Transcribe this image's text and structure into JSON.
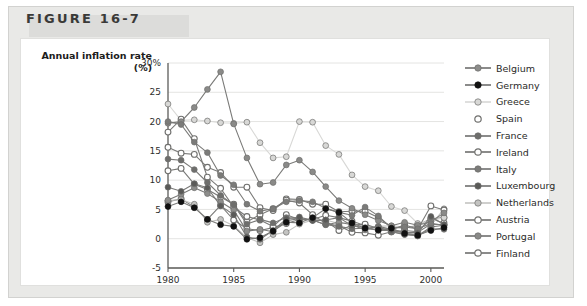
{
  "figure": {
    "number_label": "FIGURE 16-7"
  },
  "axis": {
    "y_title_line1": "Annual inflation rate",
    "y_title_line2": "(%)",
    "y_ticks": [
      "30%",
      "25",
      "20",
      "15",
      "10",
      "5",
      "0",
      "-5"
    ],
    "x_ticks": [
      "1980",
      "1985",
      "1990",
      "1995",
      "2000"
    ]
  },
  "colors": {
    "belgium": "#8d8d8b",
    "germany": "#111111",
    "greece": "#d8d8d6",
    "spain": "#ffffff",
    "france": "#6e6e6c",
    "ireland": "#8f8f8d",
    "italy": "#7b7b79",
    "luxembourg": "#5a5a58",
    "netherlands": "#c3c3c1",
    "austria": "#ffffff",
    "portugal": "#8a8a88",
    "finland": "#ffffff",
    "stroke": "#6b6b69",
    "grid": "#e4e4e2",
    "axis": "#5c5c5a",
    "panel": "#e9e9e7",
    "header_band": "#dcdcda",
    "card": "#ffffff"
  },
  "chart_data": {
    "type": "line",
    "title": "Annual inflation rate (%)",
    "xlabel": "",
    "ylabel": "Annual inflation rate (%)",
    "xlim": [
      1980,
      2001
    ],
    "ylim": [
      -5,
      30
    ],
    "grid": true,
    "legend_position": "right",
    "x": [
      1980,
      1981,
      1982,
      1983,
      1984,
      1985,
      1986,
      1987,
      1988,
      1989,
      1990,
      1991,
      1992,
      1993,
      1994,
      1995,
      1996,
      1997,
      1998,
      1999,
      2000,
      2001
    ],
    "series": [
      {
        "name": "Belgium",
        "color": "#8d8d8b",
        "filled": true,
        "values": [
          6.6,
          7.6,
          8.7,
          7.7,
          6.3,
          4.9,
          1.3,
          1.6,
          1.2,
          3.1,
          3.4,
          3.2,
          2.4,
          2.8,
          2.4,
          1.5,
          2.1,
          1.6,
          1.0,
          1.1,
          2.5,
          2.4
        ]
      },
      {
        "name": "Germany",
        "color": "#111111",
        "filled": true,
        "values": [
          5.5,
          6.3,
          5.3,
          3.3,
          2.4,
          2.1,
          -0.1,
          0.2,
          1.3,
          2.8,
          2.7,
          3.6,
          5.1,
          4.5,
          2.7,
          1.8,
          1.5,
          1.8,
          0.9,
          0.6,
          1.4,
          1.9
        ]
      },
      {
        "name": "Greece",
        "color": "#d8d8d6",
        "filled": true,
        "values": [
          23.0,
          20.2,
          20.3,
          20.1,
          19.8,
          19.7,
          19.9,
          16.4,
          13.8,
          14.0,
          20.0,
          19.9,
          15.9,
          14.4,
          10.9,
          8.9,
          8.2,
          5.5,
          4.8,
          2.6,
          3.1,
          3.6
        ]
      },
      {
        "name": "Spain",
        "color": "#ffffff",
        "filled": false,
        "values": [
          15.6,
          14.6,
          14.4,
          12.2,
          11.3,
          8.8,
          8.8,
          5.3,
          4.8,
          6.8,
          6.7,
          5.9,
          5.9,
          4.6,
          4.7,
          4.7,
          3.6,
          2.0,
          1.8,
          2.3,
          3.4,
          3.6
        ]
      },
      {
        "name": "France",
        "color": "#6e6e6c",
        "filled": true,
        "values": [
          13.6,
          13.4,
          11.8,
          9.6,
          7.4,
          5.8,
          2.5,
          3.3,
          2.7,
          3.6,
          3.4,
          3.2,
          2.4,
          2.1,
          1.7,
          1.8,
          2.0,
          1.2,
          0.7,
          0.5,
          1.7,
          1.6
        ]
      },
      {
        "name": "Ireland",
        "color": "#8f8f8d",
        "filled": false,
        "values": [
          18.2,
          20.4,
          17.1,
          10.5,
          8.6,
          5.4,
          3.8,
          3.2,
          2.1,
          4.1,
          3.3,
          3.2,
          3.1,
          1.4,
          2.3,
          2.5,
          1.7,
          1.5,
          2.4,
          1.6,
          5.6,
          4.9
        ]
      },
      {
        "name": "Italy",
        "color": "#7b7b79",
        "filled": true,
        "values": [
          20.0,
          19.5,
          16.5,
          14.7,
          10.8,
          9.2,
          5.9,
          4.7,
          5.1,
          6.3,
          6.5,
          6.3,
          5.2,
          4.5,
          4.0,
          5.4,
          3.9,
          1.8,
          2.0,
          1.7,
          2.6,
          2.3
        ]
      },
      {
        "name": "Luxembourg",
        "color": "#5a5a58",
        "filled": true,
        "values": [
          8.8,
          8.1,
          9.4,
          8.7,
          5.6,
          4.1,
          0.3,
          -0.1,
          1.4,
          3.4,
          3.7,
          3.1,
          3.2,
          3.6,
          2.2,
          1.9,
          1.4,
          1.4,
          1.0,
          1.0,
          3.8,
          2.4
        ]
      },
      {
        "name": "Netherlands",
        "color": "#c3c3c1",
        "filled": true,
        "values": [
          6.5,
          6.7,
          5.9,
          2.8,
          3.3,
          2.2,
          0.2,
          -0.7,
          0.7,
          1.1,
          2.5,
          3.2,
          3.2,
          2.6,
          2.8,
          2.0,
          2.1,
          2.2,
          2.0,
          2.0,
          2.3,
          5.1
        ]
      },
      {
        "name": "Austria",
        "color": "#ffffff",
        "filled": false,
        "values": [
          6.3,
          6.8,
          5.4,
          3.3,
          5.7,
          3.2,
          1.7,
          1.4,
          1.9,
          2.6,
          3.3,
          3.3,
          4.0,
          3.6,
          3.0,
          2.2,
          1.8,
          1.2,
          0.8,
          0.5,
          2.0,
          2.3
        ]
      },
      {
        "name": "Portugal",
        "color": "#8a8a88",
        "filled": true,
        "values": [
          19.7,
          20.0,
          22.4,
          25.5,
          28.5,
          19.6,
          13.8,
          9.3,
          9.6,
          12.6,
          13.4,
          11.4,
          8.9,
          6.5,
          5.2,
          4.1,
          3.1,
          2.2,
          2.8,
          2.3,
          2.9,
          4.4
        ]
      },
      {
        "name": "Finland",
        "color": "#ffffff",
        "filled": false,
        "values": [
          11.6,
          12.0,
          9.3,
          8.4,
          7.1,
          5.9,
          2.9,
          4.1,
          5.1,
          6.6,
          6.1,
          4.1,
          2.6,
          2.2,
          1.1,
          1.0,
          0.6,
          1.2,
          1.4,
          1.2,
          3.4,
          2.7
        ]
      }
    ]
  }
}
